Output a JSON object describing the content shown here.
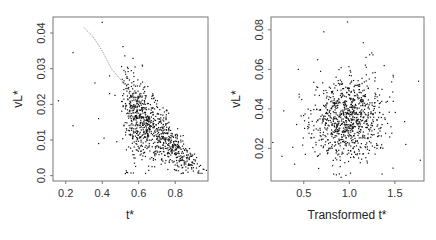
{
  "chart_data": [
    {
      "type": "scatter",
      "title": "",
      "xlabel": "t*",
      "ylabel": "vL*",
      "xlim": [
        0.13,
        0.98
      ],
      "ylim": [
        -0.0015,
        0.0445
      ],
      "xticks": [
        0.2,
        0.4,
        0.6,
        0.8
      ],
      "xtick_labels": [
        "0.2",
        "0.4",
        "0.6",
        "0.8"
      ],
      "yticks": [
        0.0,
        0.01,
        0.02,
        0.03,
        0.04
      ],
      "ytick_labels": [
        "0.0",
        "0.01",
        "0.02",
        "0.03",
        "0.04"
      ],
      "grid": false,
      "cluster": {
        "center_x": 0.77,
        "center_y": 0.006,
        "n_points": 900,
        "description": "dense negatively-sloped cloud from t*≈0.5–0.95, vL*≈0.001–0.02"
      },
      "outliers": [
        [
          0.16,
          0.021
        ],
        [
          0.24,
          0.0345
        ],
        [
          0.24,
          0.014
        ],
        [
          0.36,
          0.026
        ],
        [
          0.38,
          0.016
        ],
        [
          0.38,
          0.009
        ],
        [
          0.4,
          0.043
        ],
        [
          0.41,
          0.0105
        ],
        [
          0.44,
          0.028
        ],
        [
          0.44,
          0.023
        ],
        [
          0.47,
          0.0225
        ],
        [
          0.48,
          0.0095
        ],
        [
          0.58,
          0.0305
        ],
        [
          0.62,
          0.031
        ],
        [
          0.56,
          0.025
        ],
        [
          0.65,
          0.025
        ]
      ],
      "fitted_curve": {
        "style": "dotted",
        "points": [
          [
            0.3,
            0.0415
          ],
          [
            0.35,
            0.039
          ],
          [
            0.4,
            0.035
          ],
          [
            0.45,
            0.03
          ],
          [
            0.5,
            0.027
          ],
          [
            0.55,
            0.024
          ],
          [
            0.58,
            0.022
          ]
        ]
      }
    },
    {
      "type": "scatter",
      "title": "",
      "xlabel": "Transformed t*",
      "ylabel": "vL*",
      "xlim": [
        0.14,
        1.82
      ],
      "ylim": [
        0.0035,
        0.0865
      ],
      "xticks": [
        0.5,
        1.0,
        1.5
      ],
      "xtick_labels": [
        "0.5",
        "1.0",
        "1.5"
      ],
      "yticks": [
        0.02,
        0.04,
        0.06,
        0.08
      ],
      "ytick_labels": [
        "0.02",
        "0.04",
        "0.06",
        "0.08"
      ],
      "grid": false,
      "cluster": {
        "center_x": 0.98,
        "center_y": 0.032,
        "n_points": 900,
        "description": "roughly elliptical cloud centered near (1.0, 0.03), spread 0.4–1.6 in x and 0.01–0.07 in y"
      },
      "outliers": [
        [
          0.16,
          0.023
        ],
        [
          0.26,
          0.016
        ],
        [
          0.28,
          0.039
        ],
        [
          0.44,
          0.06
        ],
        [
          0.72,
          0.079
        ],
        [
          0.98,
          0.084
        ],
        [
          1.62,
          0.022
        ],
        [
          1.76,
          0.054
        ],
        [
          1.78,
          0.014
        ],
        [
          1.48,
          0.01
        ],
        [
          1.36,
          0.007
        ],
        [
          0.4,
          0.012
        ]
      ]
    }
  ]
}
